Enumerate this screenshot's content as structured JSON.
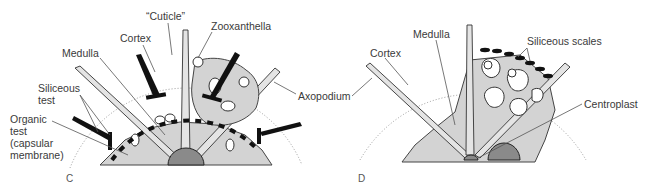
{
  "figure": {
    "panels": [
      {
        "id": "C",
        "label": "C",
        "annotations": [
          {
            "key": "cuticle",
            "text": "“Cuticle”"
          },
          {
            "key": "cortex",
            "text": "Cortex"
          },
          {
            "key": "zooxanthella",
            "text": "Zooxanthella"
          },
          {
            "key": "medulla",
            "text": "Medulla"
          },
          {
            "key": "siliceous_test_1",
            "text": "Siliceous"
          },
          {
            "key": "siliceous_test_2",
            "text": "test"
          },
          {
            "key": "organic_test_1",
            "text": "Organic"
          },
          {
            "key": "organic_test_2",
            "text": "test"
          },
          {
            "key": "organic_test_3",
            "text": "(capsular"
          },
          {
            "key": "organic_test_4",
            "text": "membrane)"
          },
          {
            "key": "axopodium",
            "text": "Axopodium"
          }
        ]
      },
      {
        "id": "D",
        "label": "D",
        "annotations": [
          {
            "key": "cortex",
            "text": "Cortex"
          },
          {
            "key": "medulla",
            "text": "Medulla"
          },
          {
            "key": "siliceous_scales",
            "text": "Siliceous scales"
          },
          {
            "key": "centroplast",
            "text": "Centroplast"
          }
        ]
      }
    ]
  },
  "colors": {
    "cytoplasm": "#d3d3d3",
    "outline": "#333333",
    "spines": "#111111",
    "label_text": "#3a3a3a"
  }
}
